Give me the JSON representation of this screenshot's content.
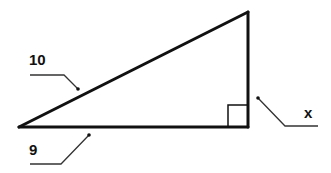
{
  "diagram": {
    "type": "right-triangle",
    "labels": {
      "hypotenuse": "10",
      "base": "9",
      "height": "x"
    },
    "colors": {
      "stroke": "#111111",
      "leader": "#333333",
      "background": "#ffffff"
    },
    "vertices": {
      "left": [
        19,
        127
      ],
      "top_right": [
        248,
        12
      ],
      "bottom_right": [
        248,
        127
      ]
    },
    "right_angle_marker": "bottom-right"
  }
}
